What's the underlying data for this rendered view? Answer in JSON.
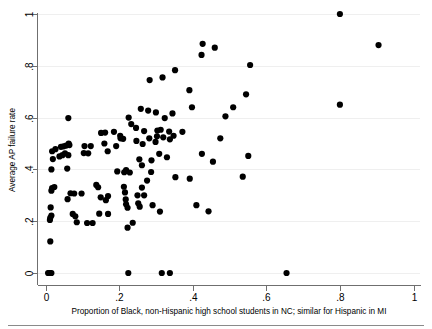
{
  "chart_data": {
    "type": "scatter",
    "title": "",
    "xlabel": "Proportion of Black, non-Hispanic high school students in NC; similar for Hispanic in MI",
    "ylabel": "Average AP failure rate",
    "xlim": [
      0,
      1
    ],
    "ylim": [
      0,
      1
    ],
    "xticks": [
      0,
      0.2,
      0.4,
      0.6,
      0.8,
      1
    ],
    "xticklabels": [
      "0",
      ".2",
      ".4",
      ".6",
      ".8",
      "1"
    ],
    "yticks": [
      0,
      0.2,
      0.4,
      0.6,
      0.8,
      1
    ],
    "yticklabels": [
      "0",
      ".2",
      ".4",
      ".6",
      ".8",
      "1"
    ],
    "grid": "horizontal",
    "legend": "none",
    "marker": {
      "shape": "circle",
      "color": "#000000",
      "size": 3.1
    },
    "points": [
      [
        0.007,
        0.0
      ],
      [
        0.01,
        0.0
      ],
      [
        0.013,
        0.0
      ],
      [
        0.016,
        0.0
      ],
      [
        0.225,
        0.0
      ],
      [
        0.316,
        0.0
      ],
      [
        0.338,
        0.0
      ],
      [
        0.655,
        0.0
      ],
      [
        0.013,
        0.122
      ],
      [
        0.012,
        0.205
      ],
      [
        0.013,
        0.213
      ],
      [
        0.016,
        0.222
      ],
      [
        0.085,
        0.196
      ],
      [
        0.113,
        0.193
      ],
      [
        0.128,
        0.193
      ],
      [
        0.074,
        0.228
      ],
      [
        0.081,
        0.219
      ],
      [
        0.146,
        0.229
      ],
      [
        0.17,
        0.228
      ],
      [
        0.223,
        0.175
      ],
      [
        0.237,
        0.194
      ],
      [
        0.014,
        0.253
      ],
      [
        0.06,
        0.285
      ],
      [
        0.098,
        0.307
      ],
      [
        0.016,
        0.318
      ],
      [
        0.018,
        0.328
      ],
      [
        0.024,
        0.332
      ],
      [
        0.068,
        0.308
      ],
      [
        0.078,
        0.307
      ],
      [
        0.138,
        0.34
      ],
      [
        0.143,
        0.331
      ],
      [
        0.15,
        0.292
      ],
      [
        0.164,
        0.281
      ],
      [
        0.17,
        0.297
      ],
      [
        0.213,
        0.333
      ],
      [
        0.216,
        0.311
      ],
      [
        0.218,
        0.284
      ],
      [
        0.219,
        0.265
      ],
      [
        0.223,
        0.252
      ],
      [
        0.25,
        0.3
      ],
      [
        0.252,
        0.269
      ],
      [
        0.256,
        0.256
      ],
      [
        0.262,
        0.33
      ],
      [
        0.268,
        0.3
      ],
      [
        0.291,
        0.262
      ],
      [
        0.311,
        0.237
      ],
      [
        0.353,
        0.37
      ],
      [
        0.016,
        0.4
      ],
      [
        0.059,
        0.403
      ],
      [
        0.214,
        0.389
      ],
      [
        0.219,
        0.397
      ],
      [
        0.229,
        0.388
      ],
      [
        0.195,
        0.392
      ],
      [
        0.262,
        0.416
      ],
      [
        0.276,
        0.357
      ],
      [
        0.287,
        0.39
      ],
      [
        0.02,
        0.44
      ],
      [
        0.038,
        0.45
      ],
      [
        0.046,
        0.455
      ],
      [
        0.053,
        0.462
      ],
      [
        0.062,
        0.455
      ],
      [
        0.104,
        0.463
      ],
      [
        0.116,
        0.462
      ],
      [
        0.169,
        0.47
      ],
      [
        0.255,
        0.439
      ],
      [
        0.288,
        0.435
      ],
      [
        0.309,
        0.46
      ],
      [
        0.33,
        0.447
      ],
      [
        0.392,
        0.364
      ],
      [
        0.018,
        0.47
      ],
      [
        0.027,
        0.478
      ],
      [
        0.042,
        0.487
      ],
      [
        0.049,
        0.489
      ],
      [
        0.056,
        0.492
      ],
      [
        0.063,
        0.5
      ],
      [
        0.065,
        0.494
      ],
      [
        0.106,
        0.49
      ],
      [
        0.123,
        0.49
      ],
      [
        0.16,
        0.5
      ],
      [
        0.192,
        0.49
      ],
      [
        0.204,
        0.52
      ],
      [
        0.211,
        0.518
      ],
      [
        0.247,
        0.51
      ],
      [
        0.264,
        0.498
      ],
      [
        0.282,
        0.52
      ],
      [
        0.299,
        0.506
      ],
      [
        0.303,
        0.528
      ],
      [
        0.32,
        0.524
      ],
      [
        0.338,
        0.516
      ],
      [
        0.062,
        0.598
      ],
      [
        0.151,
        0.541
      ],
      [
        0.162,
        0.542
      ],
      [
        0.186,
        0.545
      ],
      [
        0.203,
        0.53
      ],
      [
        0.226,
        0.6
      ],
      [
        0.233,
        0.575
      ],
      [
        0.246,
        0.56
      ],
      [
        0.268,
        0.548
      ],
      [
        0.304,
        0.55
      ],
      [
        0.313,
        0.553
      ],
      [
        0.324,
        0.598
      ],
      [
        0.336,
        0.546
      ],
      [
        0.348,
        0.53
      ],
      [
        0.372,
        0.545
      ],
      [
        0.398,
        0.64
      ],
      [
        0.3,
        0.62
      ],
      [
        0.345,
        0.616
      ],
      [
        0.259,
        0.634
      ],
      [
        0.279,
        0.627
      ],
      [
        0.391,
        0.706
      ],
      [
        0.318,
        0.755
      ],
      [
        0.283,
        0.745
      ],
      [
        0.352,
        0.783
      ],
      [
        0.424,
        0.842
      ],
      [
        0.427,
        0.885
      ],
      [
        0.46,
        0.87
      ],
      [
        0.51,
        0.64
      ],
      [
        0.545,
        0.69
      ],
      [
        0.556,
        0.803
      ],
      [
        0.8,
        1.0
      ],
      [
        0.905,
        0.88
      ],
      [
        0.8,
        0.65
      ],
      [
        0.475,
        0.52
      ],
      [
        0.489,
        0.605
      ],
      [
        0.425,
        0.46
      ],
      [
        0.455,
        0.43
      ],
      [
        0.551,
        0.452
      ],
      [
        0.536,
        0.372
      ],
      [
        0.443,
        0.238
      ],
      [
        0.41,
        0.262
      ]
    ]
  },
  "axes": {
    "y_axis_title": "Average AP failure rate",
    "x_axis_title": "Proportion of Black, non-Hispanic high school students in NC; similar for Hispanic in MI"
  }
}
